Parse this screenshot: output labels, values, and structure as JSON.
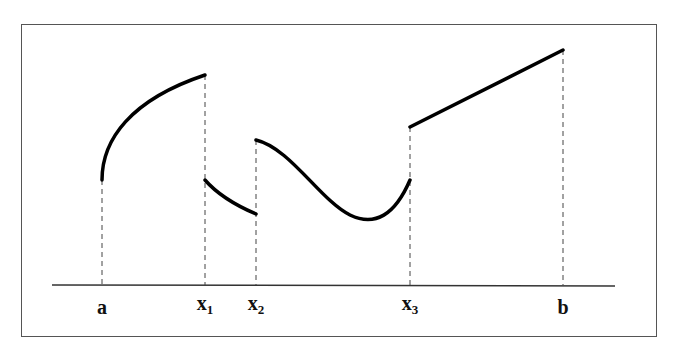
{
  "diagram": {
    "title": "",
    "axis_labels": [
      {
        "id": "a",
        "main": "a",
        "sub": ""
      },
      {
        "id": "x1",
        "main": "x",
        "sub": "1"
      },
      {
        "id": "x2",
        "main": "x",
        "sub": "2"
      },
      {
        "id": "x3",
        "main": "x",
        "sub": "3"
      },
      {
        "id": "b",
        "main": "b",
        "sub": ""
      }
    ],
    "colors": {
      "curve": "#000000",
      "axis": "#333333",
      "frame": "#555555",
      "dashes": "#444444"
    }
  }
}
